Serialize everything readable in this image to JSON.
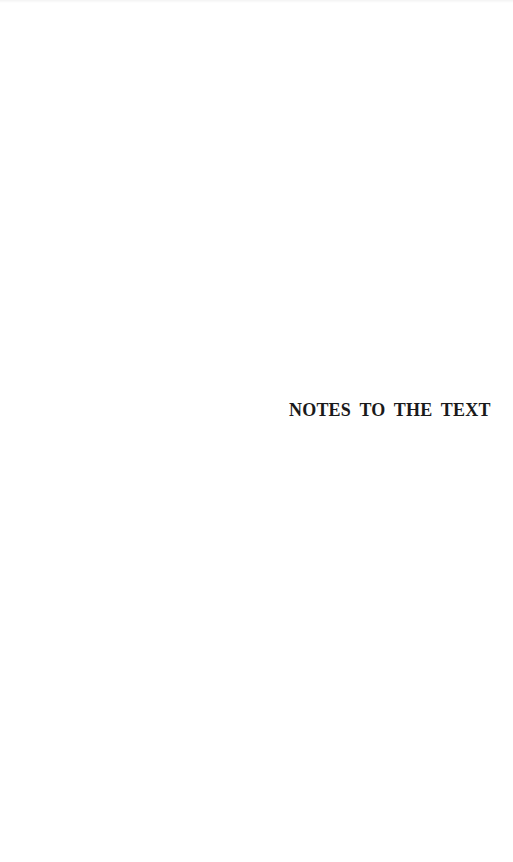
{
  "page": {
    "section_title": "NOTES TO THE TEXT"
  }
}
